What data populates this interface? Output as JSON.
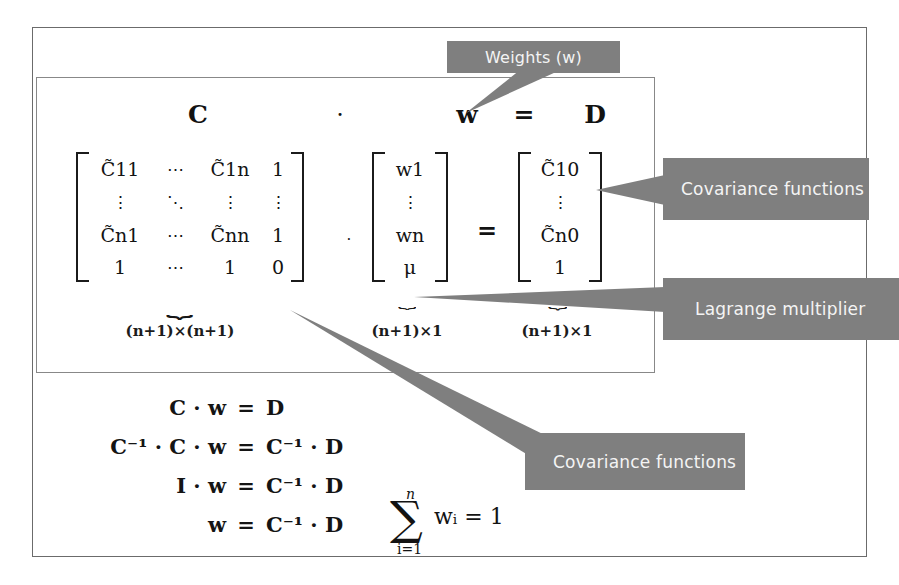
{
  "diagram": {
    "title_equation": {
      "C": "C",
      "dot": "·",
      "w": "w",
      "eq": "=",
      "D": "D"
    },
    "matrix_C": {
      "rows": [
        [
          "C̃11",
          "⋯",
          "C̃1n",
          "1"
        ],
        [
          "⋮",
          "⋱",
          "⋮",
          "⋮"
        ],
        [
          "C̃n1",
          "⋯",
          "C̃nn",
          "1"
        ],
        [
          "1",
          "⋯",
          "1",
          "0"
        ]
      ],
      "cells_plain": [
        [
          "C̃",
          "11",
          "C̃",
          "1n"
        ],
        [
          "C̃",
          "n1",
          "C̃",
          "nn"
        ]
      ],
      "dimension": "(n+1)×(n+1)"
    },
    "vector_w": {
      "rows": [
        "w1",
        "⋮",
        "wn",
        "μ"
      ],
      "dimension": "(n+1)×1"
    },
    "vector_D": {
      "rows": [
        "C̃10",
        "⋮",
        "C̃n0",
        "1"
      ],
      "dimension": "(n+1)×1"
    },
    "operators": {
      "mid_dot": "·",
      "mid_eq": "="
    },
    "derivation": [
      {
        "lhs": "C · w",
        "eq": "=",
        "rhs": "D"
      },
      {
        "lhs": "C⁻¹ · C · w",
        "eq": "=",
        "rhs": "C⁻¹ · D"
      },
      {
        "lhs": "I · w",
        "eq": "=",
        "rhs": "C⁻¹ · D"
      },
      {
        "lhs": "w",
        "eq": "=",
        "rhs": "C⁻¹ · D"
      }
    ],
    "summation": {
      "sigma": "∑",
      "upper_limit": "n",
      "lower_limit": "i=1",
      "body": "wᵢ = 1"
    },
    "callouts": {
      "weights": "Weights (w)",
      "covariance_right": "Covariance functions",
      "lagrange": "Lagrange multiplier",
      "covariance_bottom": "Covariance functions"
    },
    "colors": {
      "callout_bg": "#7f7f7f",
      "callout_text": "#f4f4f4",
      "outer_frame": "#6b6b6b",
      "inner_frame": "#888888",
      "math_ink": "#131313"
    }
  }
}
